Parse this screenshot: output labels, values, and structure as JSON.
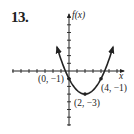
{
  "problem": {
    "number": "13."
  },
  "chart_data": {
    "type": "line",
    "title": "",
    "xlabel": "x",
    "ylabel": "f(x)",
    "function": "f(x) = (1/2)(x - 2)^2 - 3",
    "curve": "parabola opening upward with arrows at both ends",
    "x": [
      -1.5,
      -1,
      0,
      1,
      2,
      3,
      4,
      5,
      5.5
    ],
    "values": [
      3.125,
      1.5,
      -1,
      -2.5,
      -3,
      -2.5,
      -1,
      1.5,
      3.125
    ],
    "labeled_points": [
      {
        "label": "(0, −1)",
        "x": 0,
        "y": -1
      },
      {
        "label": "(2, −3)",
        "x": 2,
        "y": -3
      },
      {
        "label": "(4, −1)",
        "x": 4,
        "y": -1
      }
    ],
    "xlim": [
      -7,
      7
    ],
    "ylim": [
      -7,
      7
    ],
    "tick_spacing": 1,
    "grid": false,
    "legend": null
  },
  "labels": {
    "y_axis": "f(x)",
    "x_axis": "x",
    "point_a": "(0, −1)",
    "point_b": "(2, −3)",
    "point_c": "(4, −1)"
  },
  "colors": {
    "ink": "#222222",
    "background": "#ffffff"
  }
}
